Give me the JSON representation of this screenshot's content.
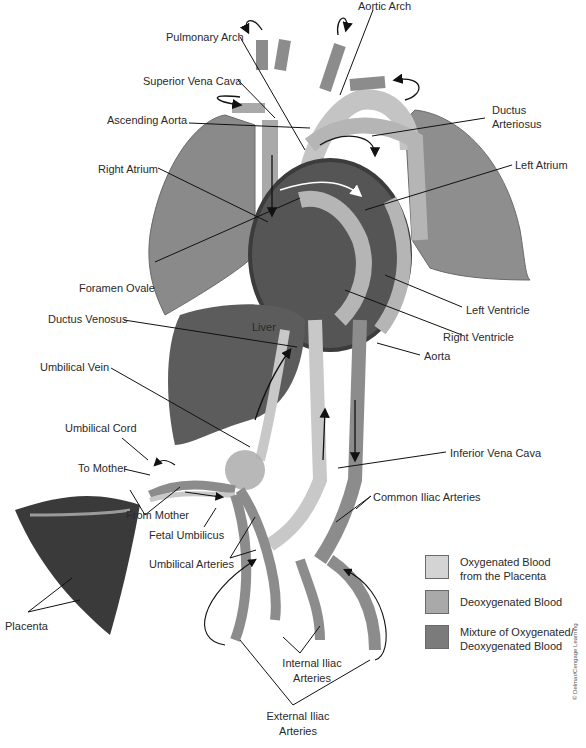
{
  "diagram": {
    "labels": {
      "aortic_arch": "Aortic Arch",
      "pulmonary_arch": "Pulmonary Arch",
      "superior_vena_cava": "Superior Vena Cava",
      "ascending_aorta": "Ascending Aorta",
      "ductus_arteriosus_1": "Ductus",
      "ductus_arteriosus_2": "Arteriosus",
      "right_atrium": "Right Atrium",
      "left_atrium": "Left Atrium",
      "foramen_ovale": "Foramen Ovale",
      "left_ventricle": "Left Ventricle",
      "ductus_venosus": "Ductus Venosus",
      "liver": "Liver",
      "right_ventricle": "Right Ventricle",
      "aorta": "Aorta",
      "umbilical_vein": "Umbilical Vein",
      "umbilical_cord": "Umbilical Cord",
      "inferior_vena_cava": "Inferior Vena Cava",
      "to_mother": "To Mother",
      "common_iliac_arteries": "Common Iliac Arteries",
      "from_mother": "From Mother",
      "fetal_umbilicus": "Fetal Umbilicus",
      "umbilical_arteries": "Umbilical Arteries",
      "placenta": "Placenta",
      "internal_iliac_1": "Internal Iliac",
      "internal_iliac_2": "Arteries",
      "external_iliac_1": "External Iliac",
      "external_iliac_2": "Arteries"
    },
    "legend": [
      {
        "label": "Oxygenated Blood\nfrom the Placenta",
        "color": "#d4d4d4"
      },
      {
        "label": "Deoxygenated Blood",
        "color": "#a9a9a9"
      },
      {
        "label": "Mixture of Oxygenated/\nDeoxygenated Blood",
        "color": "#7b7b7b"
      }
    ],
    "copyright": "© Delmar/Cengage Learning"
  }
}
